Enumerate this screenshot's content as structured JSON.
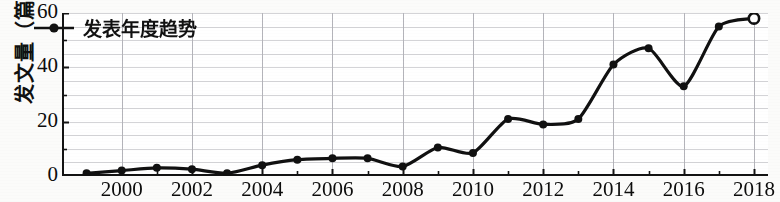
{
  "chart_data": {
    "type": "line",
    "title": "",
    "subtitle": "",
    "xlabel": "",
    "ylabel": "发文量（篇）",
    "legend": [
      "发表年度趋势"
    ],
    "legend_position": "top-left",
    "grid": true,
    "grid_minor_step": 5,
    "xlim": [
      1998.3,
      2018.4
    ],
    "ylim": [
      0,
      60
    ],
    "xtick_labels": [
      "2000",
      "2002",
      "2004",
      "2006",
      "2008",
      "2010",
      "2012",
      "2014",
      "2016",
      "2018"
    ],
    "xtick_values": [
      2000,
      2002,
      2004,
      2006,
      2008,
      2010,
      2012,
      2014,
      2016,
      2018
    ],
    "ytick_labels": [
      "0",
      "20",
      "40",
      "60"
    ],
    "ytick_values": [
      0,
      20,
      40,
      60
    ],
    "series": [
      {
        "name": "发表年度趋势",
        "color": "#111111",
        "marker": "filled-circle",
        "last_point_marker": "open-circle",
        "x": [
          1999,
          2000,
          2001,
          2002,
          2003,
          2004,
          2005,
          2006,
          2007,
          2008,
          2009,
          2010,
          2011,
          2012,
          2013,
          2014,
          2015,
          2016,
          2017,
          2018
        ],
        "values": [
          1,
          2,
          3,
          2.5,
          1,
          4,
          6,
          6.5,
          6.5,
          3.5,
          10.5,
          8.5,
          21,
          19,
          21,
          41,
          47,
          33,
          55,
          58
        ]
      }
    ]
  },
  "axis": {
    "y_title": "发文量（篇）"
  },
  "legend": {
    "label": "发表年度趋势"
  }
}
